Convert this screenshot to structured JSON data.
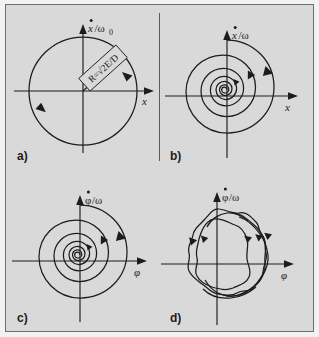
{
  "figure": {
    "background_color": "#d9d9d9",
    "border_color": "#6e6e6e",
    "stroke_color": "#1c1c1c"
  },
  "panels": [
    {
      "id": "a",
      "label": "a)",
      "x_axis_label": "x",
      "y_axis_label": "ẋ/ω",
      "y_axis_subscript": "0",
      "annotation": "R=√2E/D",
      "curve_type": "circle",
      "description": "closed circular orbit (undamped harmonic oscillator)",
      "arrow_count": 2,
      "direction": "clockwise"
    },
    {
      "id": "b",
      "label": "b)",
      "x_axis_label": "x",
      "y_axis_label": "ẋ/ω",
      "y_axis_subscript": "",
      "annotation": "",
      "curve_type": "spiral",
      "description": "inward logarithmic spiral (damped oscillator)",
      "arrow_count": 3,
      "direction": "clockwise"
    },
    {
      "id": "c",
      "label": "c)",
      "x_axis_label": "φ",
      "y_axis_label": "φ̇/ω",
      "y_axis_subscript": "",
      "annotation": "",
      "curve_type": "spiral",
      "description": "inward logarithmic spiral in phase variable phi",
      "arrow_count": 3,
      "direction": "clockwise"
    },
    {
      "id": "d",
      "label": "d)",
      "x_axis_label": "φ",
      "y_axis_label": "φ̇/ω",
      "y_axis_subscript": "",
      "annotation": "",
      "curve_type": "noisy-loops",
      "description": "noisy quasi-periodic orbit with several irregular loops",
      "arrow_count": 5,
      "direction": "clockwise"
    }
  ]
}
